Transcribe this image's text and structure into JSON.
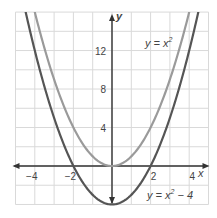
{
  "chart_data": {
    "type": "line",
    "title": "",
    "xlabel": "x",
    "ylabel": "y",
    "xlim": [
      -5,
      5
    ],
    "ylim": [
      -4,
      16
    ],
    "grid": true,
    "x_grid_step": 1,
    "y_grid_step": 2,
    "x_ticks": [
      -4,
      -2,
      2,
      4
    ],
    "x_tick_labels": [
      "−4",
      "−2",
      "2",
      "4"
    ],
    "y_ticks": [
      4,
      8,
      12
    ],
    "y_tick_labels": [
      "4",
      "8",
      "12"
    ],
    "series": [
      {
        "name": "y = x^2",
        "label": "y = x²",
        "color": "#9a9a9a",
        "function": "x^2",
        "x": [
          -4,
          -3,
          -2,
          -1,
          0,
          1,
          2,
          3,
          4
        ],
        "values": [
          16,
          9,
          4,
          1,
          0,
          1,
          4,
          9,
          16
        ]
      },
      {
        "name": "y = x^2 - 4",
        "label": "y = x² − 4",
        "color": "#555555",
        "function": "x^2-4",
        "x": [
          -4,
          -3,
          -2,
          -1,
          0,
          1,
          2,
          3,
          4
        ],
        "values": [
          12,
          5,
          0,
          -3,
          -4,
          -3,
          0,
          5,
          12
        ]
      }
    ],
    "annotations": [
      {
        "text": "y = x²",
        "near": "upper right"
      },
      {
        "text": "y = x² − 4",
        "near": "lower right"
      }
    ]
  },
  "labels": {
    "x_axis": "x",
    "y_axis": "y",
    "eq1_main": "y = x",
    "eq1_sup": "2",
    "eq2_main": "y = x",
    "eq2_sup": "2",
    "eq2_tail": " − 4"
  }
}
